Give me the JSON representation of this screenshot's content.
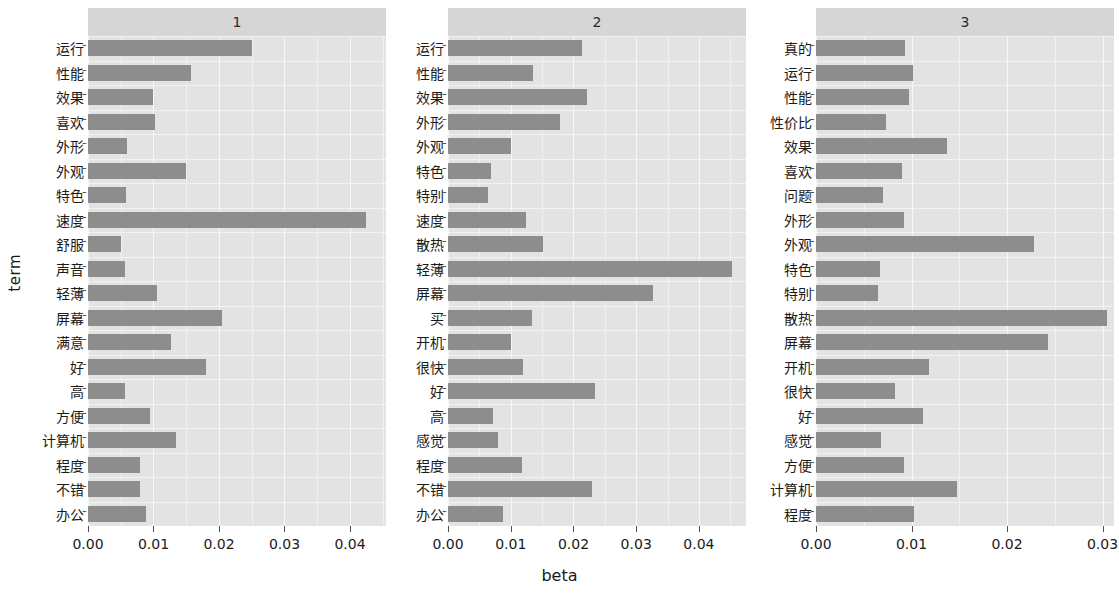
{
  "axis_titles": {
    "y": "term",
    "x": "beta"
  },
  "chart_data": {
    "type": "bar",
    "title": "",
    "xlabel": "beta",
    "ylabel": "term",
    "orientation": "horizontal",
    "grid": true,
    "legend": "none",
    "facet_strip_labels": [
      "1",
      "2",
      "3"
    ],
    "panels": [
      {
        "strip_label": "1",
        "xlim": [
          0,
          0.0455
        ],
        "xticks": [
          0.0,
          0.01,
          0.02,
          0.03,
          0.04
        ],
        "xticklabels": [
          "0.00",
          "0.01",
          "0.02",
          "0.03",
          "0.04"
        ],
        "categories": [
          "运行",
          "性能",
          "效果",
          "喜欢",
          "外形",
          "外观",
          "特色",
          "速度",
          "舒服",
          "声音",
          "轻薄",
          "屏幕",
          "满意",
          "好",
          "高",
          "方便",
          "计算机",
          "程度",
          "不错",
          "办公"
        ],
        "values": [
          0.025,
          0.0157,
          0.01,
          0.0102,
          0.006,
          0.015,
          0.0058,
          0.0425,
          0.005,
          0.0057,
          0.0105,
          0.0205,
          0.0126,
          0.018,
          0.0056,
          0.0095,
          0.0135,
          0.008,
          0.0079,
          0.0088
        ]
      },
      {
        "strip_label": "2",
        "xlim": [
          0,
          0.0475
        ],
        "xticks": [
          0.0,
          0.01,
          0.02,
          0.03,
          0.04
        ],
        "xticklabels": [
          "0.00",
          "0.01",
          "0.02",
          "0.03",
          "0.04"
        ],
        "categories": [
          "运行",
          "性能",
          "效果",
          "外形",
          "外观",
          "特色",
          "特别",
          "速度",
          "散热",
          "轻薄",
          "屏幕",
          "买",
          "开机",
          "很快",
          "好",
          "高",
          "感觉",
          "程度",
          "不错",
          "办公"
        ],
        "values": [
          0.0213,
          0.0135,
          0.0222,
          0.0178,
          0.01,
          0.0068,
          0.0064,
          0.0125,
          0.0152,
          0.0452,
          0.0327,
          0.0134,
          0.0101,
          0.0119,
          0.0235,
          0.0072,
          0.008,
          0.0118,
          0.023,
          0.0088
        ]
      },
      {
        "strip_label": "3",
        "xlim": [
          0,
          0.0312
        ],
        "xticks": [
          0.0,
          0.01,
          0.02,
          0.03
        ],
        "xticklabels": [
          "0.00",
          "0.01",
          "0.02",
          "0.03"
        ],
        "categories": [
          "真的",
          "运行",
          "性能",
          "性价比",
          "效果",
          "喜欢",
          "问题",
          "外形",
          "外观",
          "特色",
          "特别",
          "散热",
          "屏幕",
          "开机",
          "很快",
          "好",
          "感觉",
          "方便",
          "计算机",
          "程度"
        ],
        "values": [
          0.0093,
          0.0102,
          0.0097,
          0.0073,
          0.0137,
          0.009,
          0.007,
          0.0092,
          0.0228,
          0.0067,
          0.0065,
          0.0305,
          0.0243,
          0.0118,
          0.0083,
          0.0112,
          0.0068,
          0.0092,
          0.0148,
          0.0103
        ]
      }
    ]
  },
  "style": {
    "bar_color": "#8d8d8d",
    "panel_bg": "#e3e3e3",
    "strip_bg": "#d6d6d6",
    "grid_color": "#f7f7f7",
    "page_bg": "#ffffff"
  }
}
